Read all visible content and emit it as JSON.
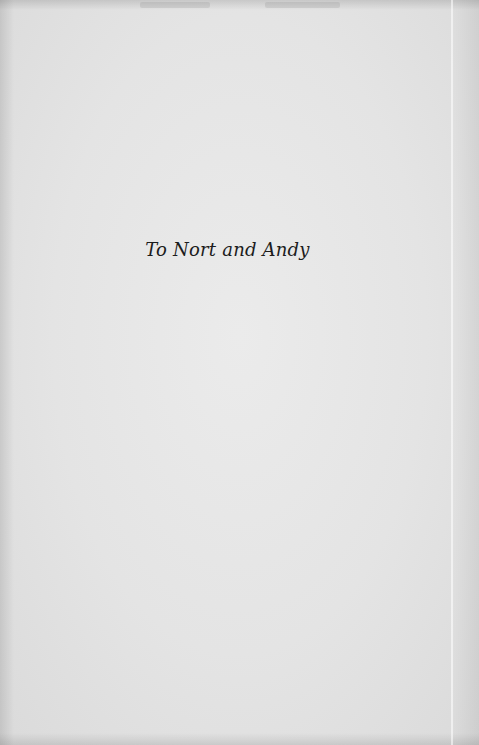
{
  "page": {
    "type": "dedication-page",
    "background_color": "#e4e4e4",
    "text_color": "#1c1c1c"
  },
  "dedication": {
    "text": "To Nort and Andy"
  }
}
